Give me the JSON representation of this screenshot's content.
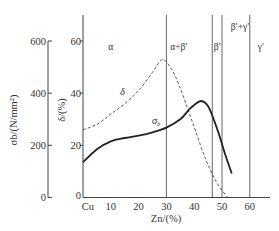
{
  "chart_data": {
    "type": "line",
    "title": "",
    "xlabel": "Zn/(%)",
    "ylabel_left": "σb/(N/mm²)",
    "ylabel_right": "δ/(%)",
    "x_ticks": [
      "Cu",
      "10",
      "20",
      "30",
      "40",
      "50",
      "60"
    ],
    "x_tick_values": [
      0,
      10,
      20,
      30,
      40,
      50,
      60
    ],
    "y_left_ticks": [
      "0",
      "200",
      "400",
      "600"
    ],
    "y_left_range": [
      0,
      600
    ],
    "y_right_ticks": [
      "0",
      "20",
      "40",
      "60"
    ],
    "y_right_range": [
      0,
      60
    ],
    "grid": false,
    "phase_boundaries": [
      30,
      46.5,
      50,
      60
    ],
    "phase_labels": [
      {
        "text": "α",
        "x": 10
      },
      {
        "text": "α+β′",
        "x": 34
      },
      {
        "text": "β′",
        "x": 48
      },
      {
        "text": "β′+γ′",
        "x": 55
      },
      {
        "text": "γ′",
        "x": 64
      }
    ],
    "series": [
      {
        "name": "σb",
        "axis": "left",
        "style": "solid",
        "x": [
          0,
          5,
          10,
          15,
          20,
          25,
          30,
          35,
          38,
          40,
          42.5,
          45,
          47,
          49,
          51,
          53.5
        ],
        "values": [
          135,
          185,
          215,
          228,
          237,
          250,
          268,
          300,
          335,
          355,
          370,
          350,
          300,
          240,
          170,
          92
        ]
      },
      {
        "name": "δ",
        "axis": "right",
        "style": "dashed",
        "x": [
          0,
          5,
          10,
          15,
          20,
          25,
          28,
          30,
          33,
          36,
          40,
          44,
          48,
          52
        ],
        "values": [
          26,
          28,
          32,
          36,
          41,
          48,
          52.5,
          52,
          47,
          39,
          27,
          15,
          6,
          0
        ]
      }
    ],
    "annotations": [
      {
        "text": "δ",
        "series": "δ"
      },
      {
        "text": "σb",
        "series": "σb"
      }
    ]
  },
  "labels": {
    "left_axis": "σb/(N/mm²)",
    "right_axis": "δ/(%)",
    "x_axis": "Zn/(%)",
    "delta_curve": "δ",
    "sigma_curve_main": "σ",
    "sigma_curve_sub": "b"
  }
}
